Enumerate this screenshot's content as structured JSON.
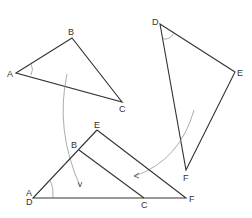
{
  "diagram": {
    "title": "",
    "triangle_abc": {
      "labels": {
        "A": "A",
        "B": "B",
        "C": "C"
      },
      "points": {
        "A": [
          16,
          73
        ],
        "B": [
          72,
          38
        ],
        "C": [
          122,
          102
        ]
      }
    },
    "triangle_def": {
      "labels": {
        "D": "D",
        "E": "E",
        "F": "F"
      },
      "points": {
        "D": [
          160,
          24
        ],
        "E": [
          235,
          72
        ],
        "F": [
          186,
          170
        ]
      }
    },
    "superimposed": {
      "labels": {
        "A": "A",
        "D": "D",
        "B": "B",
        "C": "C",
        "E": "E",
        "F": "F"
      },
      "points": {
        "AD": [
          33,
          198
        ],
        "B": [
          79,
          150
        ],
        "C": [
          144,
          198
        ],
        "E": [
          97,
          130
        ],
        "F": [
          186,
          198
        ]
      }
    },
    "colors": {
      "line": "#333333",
      "arc": "#888888",
      "background": "#ffffff"
    }
  }
}
